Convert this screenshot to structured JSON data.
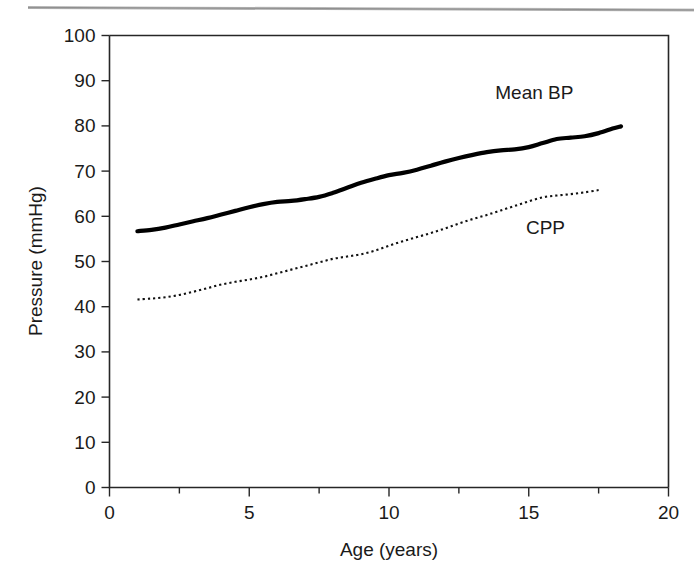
{
  "figure": {
    "page_rule": "horizontal-rule"
  },
  "chart_data": {
    "type": "line",
    "title": "",
    "subtitle": "",
    "xlabel": "Age (years)",
    "ylabel": "Pressure (mmHg)",
    "xlim": [
      0,
      20
    ],
    "ylim": [
      0,
      100
    ],
    "xticks": [
      0,
      5,
      10,
      15,
      20
    ],
    "xtick_labels": [
      "0",
      "5",
      "10",
      "15",
      "20"
    ],
    "xminor_ticks": [
      2.5,
      7.5,
      12.5,
      17.5
    ],
    "yticks": [
      0,
      10,
      20,
      30,
      40,
      50,
      60,
      70,
      80,
      90,
      100
    ],
    "ytick_labels": [
      "0",
      "10",
      "20",
      "30",
      "40",
      "50",
      "60",
      "70",
      "80",
      "90",
      "100"
    ],
    "grid": false,
    "legend_position": "inline-annotation",
    "series": [
      {
        "name": "Mean BP",
        "style": "solid-thick",
        "color": "#000000",
        "label_position": {
          "x": 15.2,
          "y": 86
        },
        "x": [
          1.0,
          1.5,
          2.0,
          2.5,
          3.0,
          3.5,
          4.0,
          4.5,
          5.0,
          5.5,
          6.0,
          6.5,
          7.0,
          7.5,
          8.0,
          8.5,
          9.0,
          9.5,
          10.0,
          10.5,
          11.0,
          11.5,
          12.0,
          12.5,
          13.0,
          13.5,
          14.0,
          14.5,
          15.0,
          15.5,
          16.0,
          16.5,
          17.0,
          17.5,
          18.0,
          18.3
        ],
        "values": [
          56.7,
          57.0,
          57.5,
          58.2,
          58.9,
          59.6,
          60.4,
          61.2,
          62.0,
          62.7,
          63.2,
          63.4,
          63.8,
          64.3,
          65.2,
          66.3,
          67.4,
          68.3,
          69.1,
          69.6,
          70.3,
          71.2,
          72.1,
          72.9,
          73.6,
          74.2,
          74.6,
          74.8,
          75.3,
          76.2,
          77.1,
          77.4,
          77.7,
          78.4,
          79.4,
          79.9
        ]
      },
      {
        "name": "CPP",
        "style": "dotted-thin",
        "color": "#111111",
        "label_position": {
          "x": 15.6,
          "y": 56
        },
        "x": [
          1.0,
          1.5,
          2.0,
          2.5,
          3.0,
          3.5,
          4.0,
          4.5,
          5.0,
          5.5,
          6.0,
          6.5,
          7.0,
          7.5,
          8.0,
          8.5,
          9.0,
          9.5,
          10.0,
          10.5,
          11.0,
          11.5,
          12.0,
          12.5,
          13.0,
          13.5,
          14.0,
          14.5,
          15.0,
          15.5,
          16.0,
          16.5,
          17.0,
          17.5
        ],
        "values": [
          41.6,
          41.8,
          42.1,
          42.6,
          43.3,
          44.1,
          44.9,
          45.5,
          46.0,
          46.6,
          47.4,
          48.2,
          49.0,
          49.8,
          50.6,
          51.1,
          51.6,
          52.4,
          53.5,
          54.5,
          55.4,
          56.3,
          57.3,
          58.4,
          59.4,
          60.3,
          61.3,
          62.3,
          63.3,
          64.2,
          64.6,
          64.9,
          65.3,
          65.8
        ]
      }
    ]
  }
}
